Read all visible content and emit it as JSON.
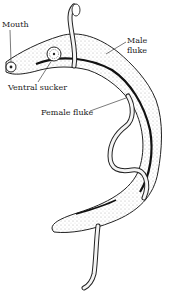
{
  "diagram": {
    "labels": {
      "mouth": "Mouth",
      "male_fluke_line1": "Male",
      "male_fluke_line2": "fluke",
      "ventral_sucker": "Ventral sucker",
      "female_fluke": "Female fluke"
    },
    "colors": {
      "ink": "#222222",
      "background": "#ffffff"
    }
  }
}
